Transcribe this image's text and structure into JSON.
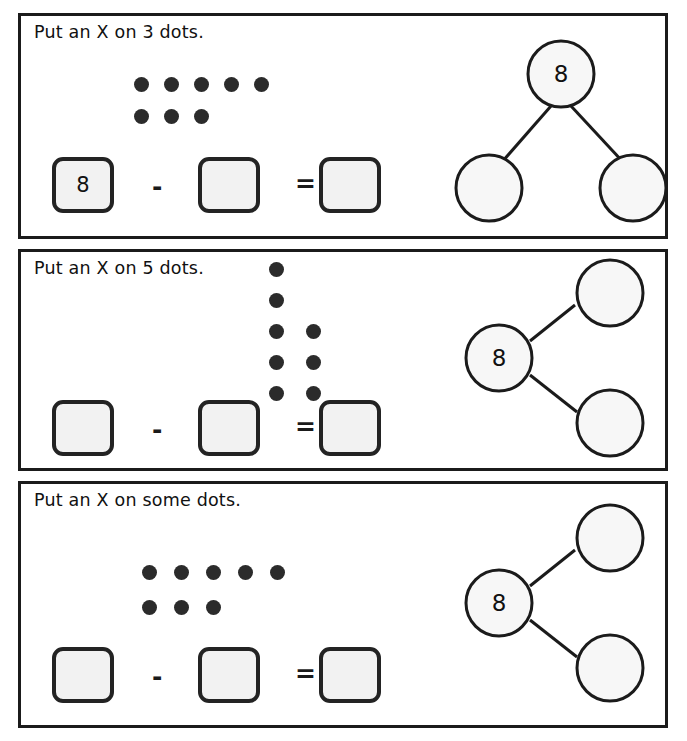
{
  "worksheet": {
    "background_color": "#ffffff",
    "ink_color": "#1b1b1b",
    "box_fill_color": "#f2f2f2",
    "dot_color": "#2b2b2b",
    "minus_sign": "-",
    "equals_sign": "=",
    "panels": [
      {
        "id": "panel-1",
        "prompt": "Put an X on 3 dots.",
        "dots": {
          "layout": "rows",
          "total": 8,
          "rows": [
            5,
            3
          ]
        },
        "equation": {
          "minuend": "8",
          "subtrahend": "",
          "difference": ""
        },
        "number_bond": {
          "orientation": "top",
          "whole": "8",
          "part_a": "",
          "part_b": ""
        }
      },
      {
        "id": "panel-2",
        "prompt": "Put an X on 5 dots.",
        "dots": {
          "layout": "columns",
          "total": 8,
          "columns": [
            5,
            3
          ]
        },
        "equation": {
          "minuend": "",
          "subtrahend": "",
          "difference": ""
        },
        "number_bond": {
          "orientation": "left",
          "whole": "8",
          "part_a": "",
          "part_b": ""
        }
      },
      {
        "id": "panel-3",
        "prompt": "Put an X on some dots.",
        "dots": {
          "layout": "rows",
          "total": 8,
          "rows": [
            5,
            3
          ]
        },
        "equation": {
          "minuend": "",
          "subtrahend": "",
          "difference": ""
        },
        "number_bond": {
          "orientation": "left",
          "whole": "8",
          "part_a": "",
          "part_b": ""
        }
      }
    ]
  }
}
